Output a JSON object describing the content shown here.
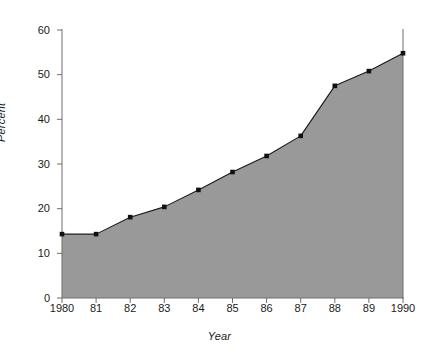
{
  "chart_data": {
    "type": "area",
    "title": "",
    "xlabel": "Year",
    "ylabel": "Percent",
    "categories": [
      "1980",
      "81",
      "82",
      "83",
      "84",
      "85",
      "86",
      "87",
      "88",
      "89",
      "1990"
    ],
    "x": [
      1980,
      1981,
      1982,
      1983,
      1984,
      1985,
      1986,
      1987,
      1988,
      1989,
      1990
    ],
    "values": [
      14.3,
      14.3,
      18.1,
      20.4,
      24.2,
      28.2,
      31.8,
      36.3,
      47.5,
      50.8,
      54.8
    ],
    "series": [
      {
        "name": "Percent",
        "values": [
          14.3,
          14.3,
          18.1,
          20.4,
          24.2,
          28.2,
          31.8,
          36.3,
          47.5,
          50.8,
          54.8
        ]
      }
    ],
    "ylim": [
      0,
      60
    ],
    "xlim": [
      1980,
      1990
    ],
    "yticks": [
      0,
      10,
      20,
      30,
      40,
      50,
      60
    ],
    "ytick_labels": [
      "0",
      "10",
      "20",
      "30",
      "40",
      "50",
      "60"
    ],
    "xtick_labels": [
      "1980",
      "81",
      "82",
      "83",
      "84",
      "85",
      "86",
      "87",
      "88",
      "89",
      "1990"
    ],
    "grid": false,
    "legend": "none",
    "markers": "filled-square",
    "fill_color": "#999999",
    "line_color": "#1a1a1a",
    "marker_color": "#111111",
    "axis_color": "#6e6e6e",
    "background_color": "#ffffff"
  }
}
